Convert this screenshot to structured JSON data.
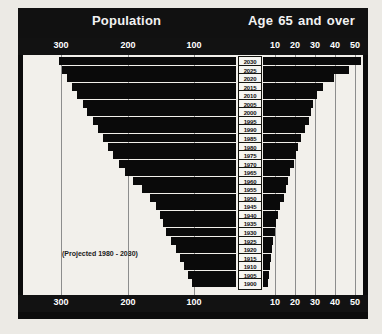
{
  "header": {
    "title_left": "Population",
    "title_right_words": [
      "Age",
      "65",
      "and",
      "over"
    ],
    "title_right": "Age 65 and over"
  },
  "annotations": {
    "projected_note": "(Projected 1980 - 2030)"
  },
  "colors": {
    "page_background": "#eceae5",
    "frame": "#0c0c0c",
    "header_band": "#111111",
    "axis_band": "#121212",
    "plot_background": "#f2f0eb",
    "bar": "#0a0a0a",
    "gridline": "#8d8d8d",
    "year_box_background": "#f6f5f1",
    "axis_text": "#ffffff",
    "label_text": "#101010"
  },
  "chart_data": {
    "type": "bar",
    "orientation": "horizontal",
    "layout": "population-funnel-pyramid",
    "grid": true,
    "legend": "none",
    "xlabel": "",
    "ylabel": "",
    "left_axis": {
      "name": "Population",
      "tick_labels": [
        "300",
        "200",
        "100"
      ],
      "tick_values": [
        300,
        200,
        100
      ],
      "direction": "right-to-left-decreasing",
      "range_shown": [
        300,
        0
      ],
      "units": "millions"
    },
    "right_axis": {
      "name": "Age 65 and over",
      "tick_labels": [
        "10",
        "20",
        "30",
        "40",
        "50"
      ],
      "tick_values": [
        10,
        20,
        30,
        40,
        50
      ],
      "direction": "left-to-right-increasing",
      "range_shown": [
        0,
        55
      ],
      "units": "millions"
    },
    "categories": [
      "2030",
      "2025",
      "2020",
      "2015",
      "2010",
      "2005",
      "2000",
      "1995",
      "1990",
      "1985",
      "1980",
      "1975",
      "1970",
      "1965",
      "1960",
      "1955",
      "1950",
      "1945",
      "1940",
      "1935",
      "1930",
      "1925",
      "1920",
      "1915",
      "1910",
      "1905",
      "1900"
    ],
    "series": [
      {
        "name": "Population",
        "axis": "left",
        "values": [
          304,
          298,
          290,
          281,
          272,
          263,
          255,
          246,
          237,
          228,
          220,
          211,
          200,
          190,
          177,
          162,
          148,
          137,
          130,
          125,
          120,
          112,
          103,
          96,
          90,
          83,
          76
        ]
      },
      {
        "name": "Age 65 and over",
        "axis": "right",
        "values": [
          51,
          45,
          37,
          31,
          28,
          26,
          25,
          24,
          22,
          20,
          18,
          17,
          16,
          14,
          13,
          12,
          11,
          9,
          8,
          7,
          6,
          5,
          4.5,
          4,
          3.5,
          3,
          2.5
        ]
      }
    ]
  },
  "axis_ticks_top": [
    {
      "label": "300",
      "x": 43
    },
    {
      "label": "200",
      "x": 110
    },
    {
      "label": "100",
      "x": 176
    },
    {
      "label": "10",
      "x": 257
    },
    {
      "label": "20",
      "x": 277
    },
    {
      "label": "30",
      "x": 297
    },
    {
      "label": "40",
      "x": 317
    },
    {
      "label": "50",
      "x": 337
    }
  ],
  "axis_ticks_bottom": [
    {
      "label": "300",
      "x": 43
    },
    {
      "label": "200",
      "x": 110
    },
    {
      "label": "100",
      "x": 176
    },
    {
      "label": "10",
      "x": 257
    },
    {
      "label": "20",
      "x": 277
    },
    {
      "label": "30",
      "x": 297
    },
    {
      "label": "40",
      "x": 317
    },
    {
      "label": "50",
      "x": 337
    }
  ],
  "gridlines_x": [
    38,
    105,
    171,
    252,
    272,
    292,
    312,
    332
  ]
}
